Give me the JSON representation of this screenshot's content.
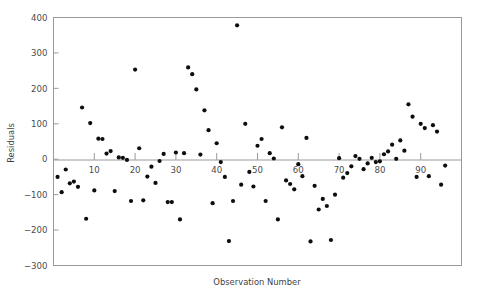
{
  "chart_data": {
    "type": "scatter",
    "title": "",
    "xlabel": "Observation Number",
    "ylabel": "Residuals",
    "xlim": [
      0,
      100
    ],
    "ylim": [
      -300,
      400
    ],
    "xticks": [
      10,
      20,
      30,
      40,
      50,
      60,
      70,
      80,
      90
    ],
    "yticks": [
      -300,
      -200,
      -100,
      0,
      100,
      200,
      300,
      400
    ],
    "xtick_labels": [
      "10",
      "20",
      "30",
      "40",
      "50",
      "60",
      "70",
      "80",
      "90"
    ],
    "ytick_labels": [
      "-300",
      "-200",
      "-100",
      "0",
      "100",
      "200",
      "300",
      "400"
    ],
    "grid": false,
    "legend": null,
    "zero_reference_line": 0,
    "marker": {
      "shape": "circle",
      "color": "#0d0d0d",
      "size": 2.1
    },
    "series": [
      {
        "name": "Residuals",
        "x": [
          1,
          2,
          3,
          4,
          5,
          6,
          7,
          8,
          9,
          10,
          11,
          12,
          13,
          14,
          15,
          16,
          17,
          18,
          19,
          20,
          21,
          22,
          23,
          24,
          25,
          26,
          27,
          28,
          29,
          30,
          31,
          32,
          33,
          34,
          35,
          36,
          37,
          38,
          39,
          40,
          41,
          42,
          43,
          44,
          45,
          46,
          47,
          48,
          49,
          50,
          51,
          52,
          53,
          54,
          55,
          56,
          57,
          58,
          59,
          60,
          61,
          62,
          63,
          64,
          65,
          66,
          67,
          68,
          69,
          70,
          71,
          72,
          73,
          74,
          75,
          76,
          77,
          78,
          79,
          80,
          81,
          82,
          83,
          84,
          85,
          86,
          87,
          88,
          89,
          90,
          91,
          92,
          93,
          94,
          95,
          96
        ],
        "y": [
          -50,
          -93,
          -29,
          -68,
          -63,
          -78,
          146,
          -168,
          102,
          -88,
          58,
          57,
          16,
          23,
          -90,
          5,
          4,
          -2,
          -118,
          253,
          31,
          -116,
          -49,
          -21,
          -67,
          -5,
          15,
          -121,
          -121,
          19,
          -170,
          17,
          259,
          240,
          197,
          13,
          138,
          82,
          -124,
          45,
          -8,
          -50,
          -231,
          -118,
          378,
          -72,
          100,
          -36,
          -77,
          38,
          57,
          -118,
          17,
          2,
          -170,
          90,
          -60,
          -70,
          -85,
          -14,
          -48,
          60,
          -232,
          -75,
          -142,
          -112,
          -132,
          -228,
          -100,
          3,
          -52,
          -39,
          -20,
          9,
          1,
          -28,
          -12,
          4,
          -8,
          -6,
          14,
          22,
          41,
          1,
          53,
          24,
          155,
          120,
          -50,
          100,
          88,
          -48,
          96,
          78,
          -72,
          -18
        ]
      }
    ]
  },
  "axis": {
    "x_title": "Observation Number",
    "y_title": "Residuals"
  }
}
